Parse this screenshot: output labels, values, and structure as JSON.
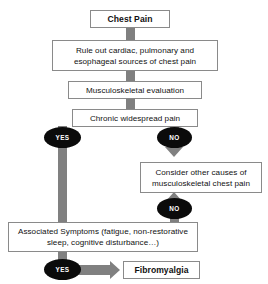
{
  "diagram": {
    "colors": {
      "connector_gray": "#808080",
      "node_border": "#8a8a8a",
      "node_background": "#ffffff",
      "decision_fill": "#0b0b0b",
      "decision_text": "#ffffff",
      "text": "#111111"
    },
    "nodes": {
      "chest_pain": "Chest Pain",
      "rule_out": "Rule out cardiac, pulmonary and esophageal sources of chest pain",
      "musculoskeletal_evaluation": "Musculoskeletal evaluation",
      "chronic_widespread_pain": "Chronic widespread pain",
      "consider_other_causes": "Consider other causes of musculoskeletal chest pain",
      "associated_symptoms": "Associated Symptoms (fatigue, non-restorative sleep, cognitive disturbance…)",
      "fibromyalgia": "Fibromyalgia"
    },
    "decisions": {
      "yes_chronic_pain": "YES",
      "no_chronic_pain": "NO",
      "no_associated_symptoms": "NO",
      "yes_associated_symptoms": "YES"
    }
  }
}
